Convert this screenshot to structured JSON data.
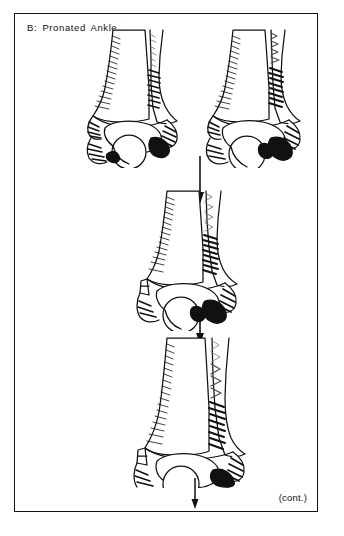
{
  "figure": {
    "title": "B:  Pronated  Ankle",
    "continuation_label": "(cont.)",
    "border_color": "#111111",
    "background_color": "#ffffff",
    "ink_color": "#111111"
  },
  "diagram": {
    "type": "anatomical-line-drawing-sequence",
    "panel_count": 4,
    "panels": [
      {
        "id": "stage-1-left",
        "position": "top-left",
        "view": "anterior",
        "caption": "",
        "structures": [
          "tibia",
          "fibula",
          "talus",
          "deltoid ligament",
          "syndesmosis",
          "medial malleolus",
          "lateral malleolus"
        ]
      },
      {
        "id": "stage-2-right",
        "position": "top-right",
        "view": "anterior",
        "caption": "",
        "structures": [
          "tibia",
          "fibula",
          "talus",
          "deltoid ligament rupture",
          "syndesmosis disruption",
          "lateral talar shift"
        ]
      },
      {
        "id": "stage-3-middle",
        "position": "middle-center",
        "view": "anterior",
        "caption": "",
        "structures": [
          "tibia",
          "fibula",
          "talus",
          "interosseous membrane tear",
          "widened mortise"
        ]
      },
      {
        "id": "stage-4-bottom",
        "position": "bottom-center",
        "view": "anterior",
        "caption": "",
        "structures": [
          "tibia",
          "fibula",
          "talus",
          "high interosseous membrane disruption",
          "proximal fibular involvement"
        ]
      }
    ],
    "arrows": [
      {
        "id": "arrow-1",
        "from": "stage-1-and-2",
        "to": "stage-3",
        "direction": "down"
      },
      {
        "id": "arrow-2",
        "from": "stage-3",
        "to": "stage-4",
        "direction": "down"
      },
      {
        "id": "arrow-3",
        "from": "stage-4",
        "to": "next-page",
        "direction": "down"
      }
    ]
  }
}
